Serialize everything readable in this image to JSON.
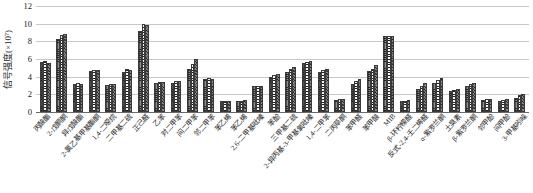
{
  "chart_data": {
    "type": "bar",
    "title": "",
    "subtitle": "",
    "xlabel": "",
    "ylabel": "信号强度(×10⁷)",
    "ylim": [
      0,
      12
    ],
    "yticks": [
      0,
      2,
      4,
      6,
      8,
      10,
      12
    ],
    "grid": true,
    "legend_position": "none",
    "bar_count_per_group": 3,
    "categories": [
      "丙酸酯",
      "2-戊酮酮",
      "异戊酸酯",
      "2-氯乙基甲基酯酮",
      "1,4-二噁烷",
      "二甲基二硫",
      "正己醛",
      "乙苯",
      "对二甲苯",
      "间二甲苯",
      "邻二甲苯",
      "苯乙烯",
      "苯乙烯",
      "2,6-二甲基吡嗪",
      "苯酚",
      "三甲基二硫",
      "2-异丙基-3-甲基氧吡嗪",
      "1,4-二甲苯",
      "二丙草酮",
      "苯甲醛",
      "苯甲酸",
      "MIB",
      "β-环柠檬醛",
      "反式-2,4-壬二烯醛",
      "α-紫罗兰酮",
      "土臭素",
      "β-紫罗兰酮",
      "邻甲酚",
      "间甲酚",
      "3-甲基吲哚"
    ],
    "series": [
      {
        "name": "系列1",
        "values": [
          5.7,
          8.3,
          3.2,
          4.6,
          3.1,
          4.5,
          9.2,
          3.3,
          3.3,
          4.9,
          3.7,
          1.2,
          1.3,
          2.9,
          4.0,
          4.5,
          5.6,
          4.5,
          1.4,
          3.2,
          4.6,
          8.6,
          1.3,
          2.6,
          3.3,
          2.4,
          3.0,
          1.4,
          1.3,
          1.6
        ]
      },
      {
        "name": "系列2",
        "values": [
          5.8,
          8.7,
          3.3,
          4.8,
          3.2,
          4.9,
          10.0,
          3.4,
          3.5,
          5.4,
          3.8,
          1.2,
          1.3,
          3.0,
          4.2,
          4.9,
          5.7,
          4.7,
          1.5,
          3.5,
          4.9,
          8.6,
          1.3,
          3.0,
          3.6,
          2.5,
          3.2,
          1.5,
          1.4,
          1.9
        ]
      },
      {
        "name": "系列3",
        "values": [
          5.6,
          8.8,
          3.2,
          4.8,
          3.2,
          4.7,
          9.8,
          3.4,
          3.5,
          6.0,
          3.7,
          1.2,
          1.4,
          2.9,
          4.3,
          5.1,
          5.8,
          4.9,
          1.5,
          3.7,
          5.3,
          8.6,
          1.4,
          3.3,
          3.9,
          2.6,
          3.3,
          1.5,
          1.5,
          2.0
        ]
      }
    ]
  }
}
